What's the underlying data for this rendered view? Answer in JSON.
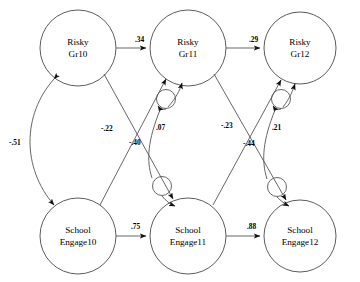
{
  "diagram": {
    "type": "path-diagram",
    "title": "",
    "nodes": [
      {
        "id": "risky10",
        "line1": "Risky",
        "line2": "Gr10",
        "cx": 78,
        "cy": 48,
        "r": 38
      },
      {
        "id": "risky11",
        "line1": "Risky",
        "line2": "Gr11",
        "cx": 188,
        "cy": 48,
        "r": 38
      },
      {
        "id": "risky12",
        "line1": "Risky",
        "line2": "Gr12",
        "cx": 300,
        "cy": 48,
        "r": 36
      },
      {
        "id": "engage10",
        "line1": "School",
        "line2": "Engage10",
        "cx": 78,
        "cy": 236,
        "r": 38
      },
      {
        "id": "engage11",
        "line1": "School",
        "line2": "Engage11",
        "cx": 188,
        "cy": 236,
        "r": 38
      },
      {
        "id": "engage12",
        "line1": "School",
        "line2": "Engage12",
        "cx": 300,
        "cy": 236,
        "r": 36
      }
    ],
    "paths": [
      {
        "id": "risky10-risky11",
        "from": "risky10",
        "to": "risky11",
        "coef": ".34",
        "label_x": 135,
        "label_y": 42,
        "kind": "directed"
      },
      {
        "id": "risky11-risky12",
        "from": "risky11",
        "to": "risky12",
        "coef": ".29",
        "label_x": 249,
        "label_y": 42,
        "kind": "directed"
      },
      {
        "id": "engage10-engage11",
        "from": "engage10",
        "to": "engage11",
        "coef": ".75",
        "label_x": 131,
        "label_y": 229,
        "kind": "directed"
      },
      {
        "id": "engage11-engage12",
        "from": "engage11",
        "to": "engage12",
        "coef": ".88",
        "label_x": 247,
        "label_y": 229,
        "kind": "directed"
      },
      {
        "id": "risky10-engage11",
        "from": "risky10",
        "to": "engage11",
        "coef": "-.40",
        "label_x": 129,
        "label_y": 145,
        "kind": "directed"
      },
      {
        "id": "engage10-risky11",
        "from": "engage10",
        "to": "risky11",
        "coef": "-.22",
        "label_x": 101,
        "label_y": 131,
        "kind": "directed"
      },
      {
        "id": "risky11-engage12",
        "from": "risky11",
        "to": "engage12",
        "coef": "-.44",
        "label_x": 243,
        "label_y": 146,
        "kind": "directed"
      },
      {
        "id": "engage11-risky12",
        "from": "engage11",
        "to": "risky12",
        "coef": "-.23",
        "label_x": 221,
        "label_y": 128,
        "kind": "directed"
      },
      {
        "id": "risky10-engage10",
        "from": "risky10",
        "to": "engage10",
        "coef": "-.51",
        "label_x": 9,
        "label_y": 145,
        "kind": "correlation-curved"
      },
      {
        "id": "disturb11",
        "from": "risky11",
        "to": "engage11",
        "coef": ".07",
        "label_x": 156,
        "label_y": 130,
        "kind": "disturbance-correlation"
      },
      {
        "id": "disturb12",
        "from": "risky12",
        "to": "engage12",
        "coef": ".21",
        "label_x": 272,
        "label_y": 130,
        "kind": "disturbance-correlation"
      }
    ],
    "coefficients": [
      ".34",
      ".29",
      ".75",
      ".88",
      "-.40",
      "-.22",
      "-.44",
      "-.23",
      "-.51",
      ".07",
      ".21"
    ],
    "colors": {
      "background": "#ffffff",
      "node_stroke": "#4a4a4a",
      "edge_stroke": "#555555",
      "text": "#000000"
    }
  }
}
